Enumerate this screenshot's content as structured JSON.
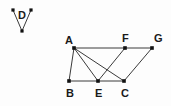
{
  "figure": {
    "background_color": "#fdfdfd",
    "line_color": "#3a3a3a",
    "point_color": "#111111",
    "label_color": "#1a1a1a"
  },
  "angle_figure": {
    "name": "angle-d",
    "label": "D",
    "label_x": 22,
    "label_y": 19,
    "vertices": [
      {
        "name": "d-arm-left-end",
        "x": 13,
        "y": 10
      },
      {
        "name": "d-apex",
        "x": 22,
        "y": 31
      },
      {
        "name": "d-arm-right-end",
        "x": 31,
        "y": 10
      }
    ],
    "edges": [
      {
        "name": "d-arm-left",
        "from": "d-arm-left-end",
        "to": "d-apex"
      },
      {
        "name": "d-arm-right",
        "from": "d-apex",
        "to": "d-arm-right-end"
      }
    ]
  },
  "main_figure": {
    "name": "polygon-abcefg",
    "points": [
      {
        "id": "A",
        "label": "A",
        "x": 74,
        "y": 48,
        "label_x": 65,
        "label_y": 44
      },
      {
        "id": "F",
        "label": "F",
        "x": 125,
        "y": 48,
        "label_x": 122,
        "label_y": 42
      },
      {
        "id": "G",
        "label": "G",
        "x": 152,
        "y": 48,
        "label_x": 154,
        "label_y": 42
      },
      {
        "id": "B",
        "label": "B",
        "x": 69,
        "y": 81,
        "label_x": 66,
        "label_y": 97
      },
      {
        "id": "E",
        "label": "E",
        "x": 98,
        "y": 81,
        "label_x": 95,
        "label_y": 97
      },
      {
        "id": "C",
        "label": "C",
        "x": 124,
        "y": 81,
        "label_x": 121,
        "label_y": 97
      }
    ],
    "edges": [
      {
        "name": "edge-A-F",
        "from": "A",
        "to": "F"
      },
      {
        "name": "edge-F-G",
        "from": "F",
        "to": "G"
      },
      {
        "name": "edge-A-B",
        "from": "A",
        "to": "B"
      },
      {
        "name": "edge-A-E",
        "from": "A",
        "to": "E"
      },
      {
        "name": "edge-A-C",
        "from": "A",
        "to": "C"
      },
      {
        "name": "edge-F-E",
        "from": "F",
        "to": "E"
      },
      {
        "name": "edge-G-C",
        "from": "G",
        "to": "C"
      },
      {
        "name": "edge-B-E",
        "from": "B",
        "to": "E"
      },
      {
        "name": "edge-E-C",
        "from": "E",
        "to": "C"
      }
    ]
  }
}
